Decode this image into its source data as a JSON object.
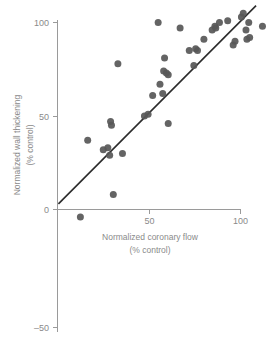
{
  "chart_data": {
    "type": "scatter",
    "title": "",
    "xlabel": "Normalized coronary flow",
    "xlabel_sub": "(% control)",
    "ylabel": "Normalized wall thickening",
    "ylabel_sub": "(% control)",
    "xlim": [
      -10,
      120
    ],
    "ylim": [
      -55,
      112
    ],
    "xticks": [
      0,
      50,
      100
    ],
    "xtick_labels": [
      "0",
      "50",
      "100"
    ],
    "yticks": [
      -50,
      0,
      50,
      100
    ],
    "ytick_labels": [
      "–50",
      "0",
      "50",
      "100"
    ],
    "grid": false,
    "legend": "none",
    "marker_color": "#575757",
    "line_color": "#2b2b2b",
    "axis_color": "#9a9a9a",
    "text_color": "#8a8a8a",
    "points": [
      [
        12.5,
        -4
      ],
      [
        16.5,
        37
      ],
      [
        25.0,
        32
      ],
      [
        27.5,
        33
      ],
      [
        28.5,
        29
      ],
      [
        29.0,
        47
      ],
      [
        29.5,
        45
      ],
      [
        30.5,
        8
      ],
      [
        33.0,
        78
      ],
      [
        35.5,
        30
      ],
      [
        47.5,
        50
      ],
      [
        49.5,
        51
      ],
      [
        52.0,
        61
      ],
      [
        55.0,
        100
      ],
      [
        56.0,
        67
      ],
      [
        57.5,
        62
      ],
      [
        58.0,
        74
      ],
      [
        58.5,
        81
      ],
      [
        59.5,
        73
      ],
      [
        60.5,
        72
      ],
      [
        60.5,
        46
      ],
      [
        67.0,
        97
      ],
      [
        72.0,
        85
      ],
      [
        74.5,
        77
      ],
      [
        75.5,
        86
      ],
      [
        76.5,
        85
      ],
      [
        80.0,
        91
      ],
      [
        84.5,
        96
      ],
      [
        86.0,
        98
      ],
      [
        86.5,
        97
      ],
      [
        88.5,
        100
      ],
      [
        93.0,
        101
      ],
      [
        96.0,
        88
      ],
      [
        97.0,
        90
      ],
      [
        100.5,
        103
      ],
      [
        101.5,
        105
      ],
      [
        103.0,
        96
      ],
      [
        103.5,
        91
      ],
      [
        104.5,
        100
      ],
      [
        105.0,
        92
      ],
      [
        112.0,
        98
      ]
    ],
    "trend_line": {
      "x_start": 0.5,
      "y_start": 3,
      "x_end": 108.5,
      "y_end": 109,
      "description": "regression line"
    }
  }
}
